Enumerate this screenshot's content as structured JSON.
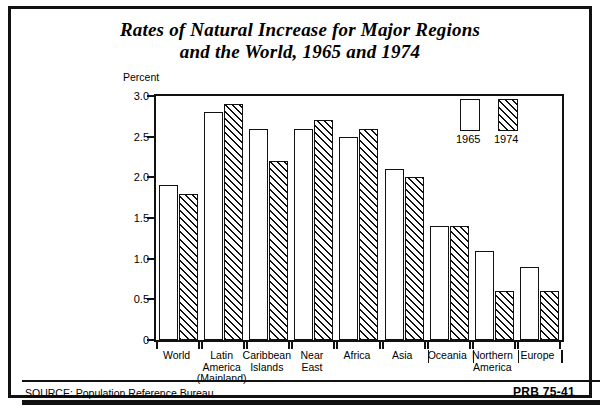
{
  "title": {
    "line1": "Rates of Natural Increase for Major Regions",
    "line2": "and the World, 1965 and 1974"
  },
  "footer": {
    "source": "SOURCE: Population Reference Bureau",
    "code": "PRB 75-41"
  },
  "legend": {
    "items": [
      {
        "label": "1965",
        "style": "solid-white"
      },
      {
        "label": "1974",
        "style": "diagonal-hatch"
      }
    ]
  },
  "chart_data": {
    "type": "bar",
    "title": "Rates of Natural Increase for Major Regions and the World, 1965 and 1974",
    "xlabel": "",
    "ylabel": "Percent",
    "ylim": [
      0,
      3.0
    ],
    "yticks": [
      0,
      0.5,
      1.0,
      1.5,
      2.0,
      2.5,
      3.0
    ],
    "ytick_labels": [
      "0",
      "0.5",
      "1.0",
      "1.5",
      "2.0",
      "2.5",
      "3.0"
    ],
    "grid": false,
    "legend_position": "top-right-inside",
    "categories": [
      "World",
      "Latin America (Mainland)",
      "Caribbean Islands",
      "Near East",
      "Africa",
      "Asia",
      "Oceania",
      "Northern America",
      "Europe"
    ],
    "category_label_lines": [
      [
        "World"
      ],
      [
        "Latin",
        "America",
        "(Mainland)"
      ],
      [
        "Caribbean",
        "Islands"
      ],
      [
        "Near",
        "East"
      ],
      [
        "Africa"
      ],
      [
        "Asia"
      ],
      [
        "Oceania"
      ],
      [
        "Northern",
        "America"
      ],
      [
        "Europe"
      ]
    ],
    "series": [
      {
        "name": "1965",
        "values": [
          1.9,
          2.8,
          2.6,
          2.6,
          2.5,
          2.1,
          1.4,
          1.1,
          0.9
        ]
      },
      {
        "name": "1974",
        "values": [
          1.8,
          2.9,
          2.2,
          2.7,
          2.6,
          2.0,
          1.4,
          0.6,
          0.6
        ]
      }
    ]
  }
}
